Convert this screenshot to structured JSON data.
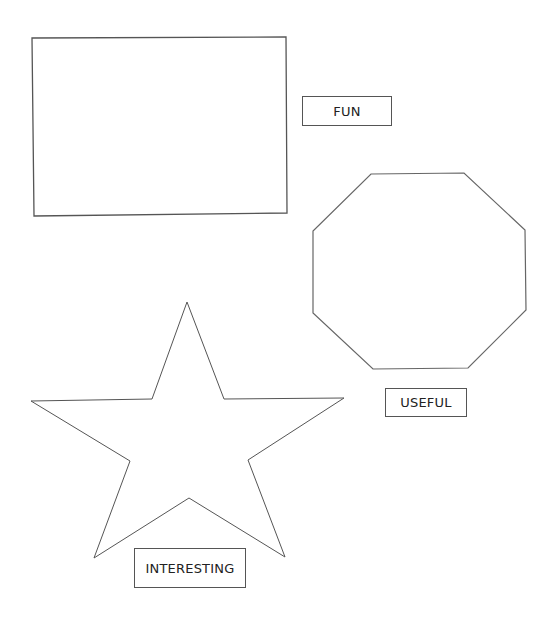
{
  "shapes": [
    {
      "name": "rectangle",
      "points": "32,38 286,37 287,213 34,216"
    },
    {
      "name": "octagon",
      "points": "371,174 464,173 525,230 526,310 468,368 373,369 313,313 313,231"
    },
    {
      "name": "star",
      "points": "187,302 224,399 344,398 248,460 285,557 189,498 94,558 130,461 31,401 152,399"
    }
  ],
  "labels": {
    "fun": "FUN",
    "useful": "USEFUL",
    "interesting": "INTERESTING"
  },
  "colors": {
    "stroke": "#555555",
    "background": "#ffffff"
  }
}
